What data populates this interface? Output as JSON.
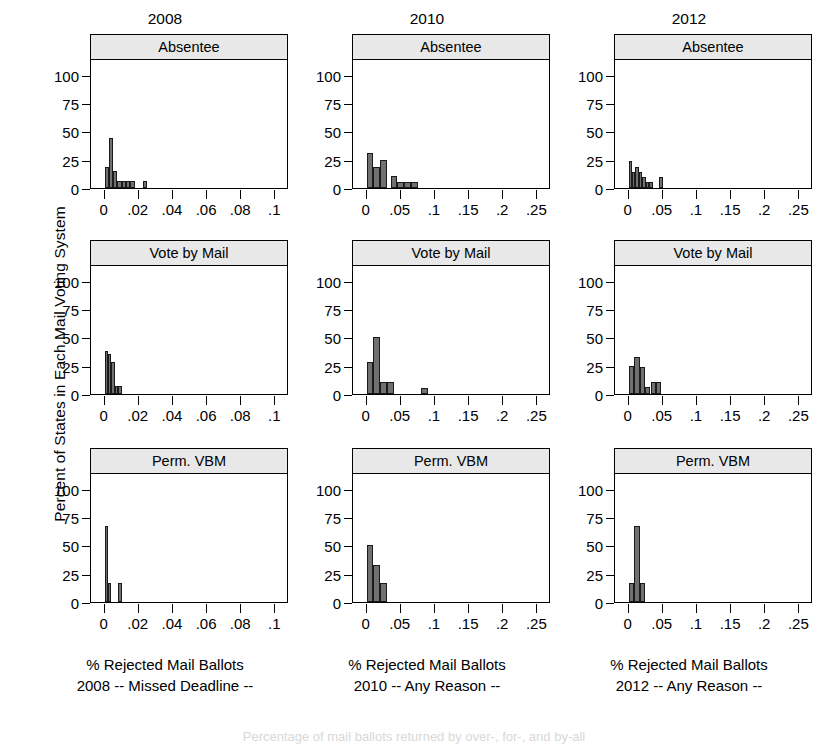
{
  "figure": {
    "ylabel": "Percent of States in Each Mail Voting System",
    "bleed_text": "Percentage of mail ballots returned by over-, for-, and by-all"
  },
  "chart_data": {
    "type": "bar",
    "title": "",
    "ylabel": "Percent of States in Each Mail Voting System",
    "ylim": [
      0,
      115
    ],
    "yticks": [
      0,
      25,
      50,
      75,
      100
    ],
    "ytick_labels": [
      "0",
      "25",
      "50",
      "75",
      "100"
    ],
    "grid": false,
    "legend": false,
    "layout": "3x3 lattice of histograms, columns = election year, rows = mail voting system",
    "columns": [
      {
        "title": "2008",
        "xlabel_line1": "% Rejected Mail Ballots",
        "xlabel_line2": "2008 -- Missed Deadline --",
        "xlim": [
          -0.008,
          0.108
        ],
        "xticks": [
          0,
          0.02,
          0.04,
          0.06,
          0.08,
          0.1
        ],
        "xtick_labels": [
          "0",
          ".02",
          ".04",
          ".06",
          ".08",
          ".1"
        ]
      },
      {
        "title": "2010",
        "xlabel_line1": "% Rejected Mail Ballots",
        "xlabel_line2": "2010 -- Any Reason --",
        "xlim": [
          -0.02,
          0.27
        ],
        "xticks": [
          0,
          0.05,
          0.1,
          0.15,
          0.2,
          0.25
        ],
        "xtick_labels": [
          "0",
          ".05",
          ".1",
          ".15",
          ".2",
          ".25"
        ]
      },
      {
        "title": "2012",
        "xlabel_line1": "% Rejected Mail Ballots",
        "xlabel_line2": "2012 -- Any Reason --",
        "xlim": [
          -0.02,
          0.27
        ],
        "xticks": [
          0,
          0.05,
          0.1,
          0.15,
          0.2,
          0.25
        ],
        "xtick_labels": [
          "0",
          ".05",
          ".1",
          ".15",
          ".2",
          ".25"
        ]
      }
    ],
    "panels": [
      {
        "row": 0,
        "col": 0,
        "strip": "Absentee",
        "year": "2008",
        "bin_width": 0.0025,
        "bins": [
          {
            "x0": 0.0,
            "value": 19
          },
          {
            "x0": 0.0025,
            "value": 44
          },
          {
            "x0": 0.005,
            "value": 15
          },
          {
            "x0": 0.0075,
            "value": 6
          },
          {
            "x0": 0.01,
            "value": 6
          },
          {
            "x0": 0.0125,
            "value": 6
          },
          {
            "x0": 0.015,
            "value": 6
          },
          {
            "x0": 0.0225,
            "value": 6
          }
        ]
      },
      {
        "row": 0,
        "col": 1,
        "strip": "Absentee",
        "year": "2010",
        "bin_width": 0.01,
        "bins": [
          {
            "x0": 0.0,
            "value": 31
          },
          {
            "x0": 0.01,
            "value": 19
          },
          {
            "x0": 0.02,
            "value": 25
          },
          {
            "x0": 0.035,
            "value": 11
          },
          {
            "x0": 0.045,
            "value": 5
          },
          {
            "x0": 0.055,
            "value": 5
          },
          {
            "x0": 0.065,
            "value": 5
          }
        ]
      },
      {
        "row": 0,
        "col": 2,
        "strip": "Absentee",
        "year": "2012",
        "bin_width": 0.005,
        "bins": [
          {
            "x0": 0.0,
            "value": 24
          },
          {
            "x0": 0.005,
            "value": 14
          },
          {
            "x0": 0.01,
            "value": 19
          },
          {
            "x0": 0.015,
            "value": 14
          },
          {
            "x0": 0.02,
            "value": 10
          },
          {
            "x0": 0.025,
            "value": 5
          },
          {
            "x0": 0.03,
            "value": 5
          },
          {
            "x0": 0.045,
            "value": 10
          }
        ]
      },
      {
        "row": 1,
        "col": 0,
        "strip": "Vote by Mail",
        "year": "2008",
        "bin_width": 0.002,
        "bins": [
          {
            "x0": 0.0,
            "value": 38
          },
          {
            "x0": 0.002,
            "value": 35
          },
          {
            "x0": 0.004,
            "value": 28
          },
          {
            "x0": 0.006,
            "value": 7
          },
          {
            "x0": 0.008,
            "value": 7
          }
        ]
      },
      {
        "row": 1,
        "col": 1,
        "strip": "Vote by Mail",
        "year": "2010",
        "bin_width": 0.01,
        "bins": [
          {
            "x0": 0.0,
            "value": 28
          },
          {
            "x0": 0.01,
            "value": 50
          },
          {
            "x0": 0.02,
            "value": 11
          },
          {
            "x0": 0.03,
            "value": 11
          },
          {
            "x0": 0.08,
            "value": 5
          }
        ]
      },
      {
        "row": 1,
        "col": 2,
        "strip": "Vote by Mail",
        "year": "2012",
        "bin_width": 0.008,
        "bins": [
          {
            "x0": 0.0,
            "value": 25
          },
          {
            "x0": 0.008,
            "value": 33
          },
          {
            "x0": 0.016,
            "value": 24
          },
          {
            "x0": 0.024,
            "value": 6
          },
          {
            "x0": 0.032,
            "value": 11
          },
          {
            "x0": 0.04,
            "value": 11
          }
        ]
      },
      {
        "row": 2,
        "col": 0,
        "strip": "Perm. VBM",
        "year": "2008",
        "bin_width": 0.002,
        "bins": [
          {
            "x0": 0.0,
            "value": 67
          },
          {
            "x0": 0.002,
            "value": 17
          },
          {
            "x0": 0.008,
            "value": 17
          }
        ]
      },
      {
        "row": 2,
        "col": 1,
        "strip": "Perm. VBM",
        "year": "2010",
        "bin_width": 0.01,
        "bins": [
          {
            "x0": 0.0,
            "value": 50
          },
          {
            "x0": 0.01,
            "value": 33
          },
          {
            "x0": 0.02,
            "value": 17
          }
        ]
      },
      {
        "row": 2,
        "col": 2,
        "strip": "Perm. VBM",
        "year": "2012",
        "bin_width": 0.008,
        "bins": [
          {
            "x0": 0.0,
            "value": 17
          },
          {
            "x0": 0.008,
            "value": 67
          },
          {
            "x0": 0.016,
            "value": 17
          }
        ]
      }
    ],
    "colors": {
      "bar_fill": "#707070",
      "bar_edge": "#1a1a1a",
      "strip_fill": "#e8e8e8",
      "axis": "#000000",
      "background": "#ffffff"
    }
  }
}
